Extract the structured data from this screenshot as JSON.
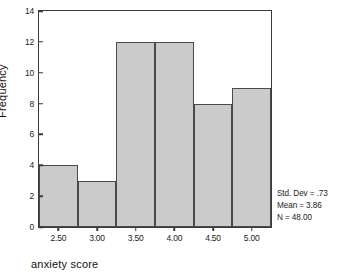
{
  "chart_data": {
    "type": "bar",
    "title": "",
    "subtitle": "",
    "xlabel": "anxiety score",
    "ylabel": "Frequency",
    "categories": [
      "2.50",
      "3.00",
      "3.50",
      "4.00",
      "4.50",
      "5.00"
    ],
    "values": [
      4,
      3,
      12,
      12,
      8,
      9
    ],
    "bin_edges": [
      2.25,
      2.75,
      3.25,
      3.75,
      4.25,
      4.75,
      5.25
    ],
    "bin_width": 0.5,
    "xlim": [
      2.25,
      5.25
    ],
    "ylim": [
      0,
      14
    ],
    "xticks": [
      "2.50",
      "3.00",
      "3.50",
      "4.00",
      "4.50",
      "5.00"
    ],
    "xtick_values": [
      2.5,
      3.0,
      3.5,
      4.0,
      4.5,
      5.0
    ],
    "yticks": [
      "0",
      "2",
      "4",
      "6",
      "8",
      "10",
      "12",
      "14"
    ],
    "ytick_values": [
      0,
      2,
      4,
      6,
      8,
      10,
      12,
      14
    ],
    "grid": false,
    "legend": false,
    "legend_position": "none",
    "bar_fill_color": "#cbcbcb",
    "bar_edge_color": "#4a4a4a",
    "axis_color": "#3a3a3a",
    "background_color": "#ffffff",
    "annotations": [
      "Std. Dev = .73",
      "Mean = 3.86",
      "N = 48.00"
    ]
  },
  "stats": {
    "std_dev_line": "Std. Dev = .73",
    "mean_line": "Mean = 3.86",
    "n_line": "N = 48.00",
    "std_dev": ".73",
    "mean": "3.86",
    "n": "48.00"
  },
  "axes": {
    "x_title": "anxiety score",
    "y_title": "Frequency"
  }
}
